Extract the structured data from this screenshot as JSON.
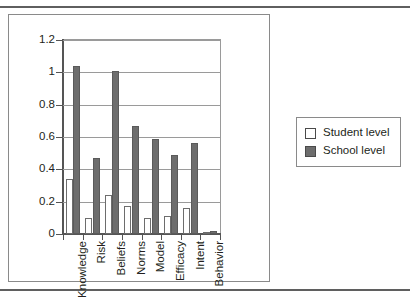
{
  "chart_data": {
    "type": "bar",
    "title": "",
    "xlabel": "",
    "ylabel": "",
    "categories": [
      "Knowledge",
      "Risk",
      "Beliefs",
      "Norms",
      "Model",
      "Efficacy",
      "Intent",
      "Behavior"
    ],
    "series": [
      {
        "name": "Student level",
        "values": [
          0.34,
          0.1,
          0.24,
          0.175,
          0.1,
          0.11,
          0.16,
          0.005
        ]
      },
      {
        "name": "School level",
        "values": [
          1.04,
          0.47,
          1.01,
          0.67,
          0.59,
          0.49,
          0.56,
          0.02
        ]
      }
    ],
    "ylim": [
      0,
      1.2
    ],
    "ytick_labels": [
      "1.2",
      "1",
      "0.8",
      "0.6",
      "0.4",
      "0.2",
      "0"
    ],
    "ytick_values": [
      1.2,
      1.0,
      0.8,
      0.6,
      0.4,
      0.2,
      0
    ],
    "grid": true,
    "legend_position": "right",
    "colors": {
      "student": "#ffffff",
      "school": "#6d6d6d",
      "outline": "#5a5a5a",
      "axis": "#555555",
      "grid": "#9a9a9a",
      "text": "#231f20"
    }
  },
  "legend": {
    "items": [
      {
        "label": "Student level",
        "swatch": "student"
      },
      {
        "label": "School level",
        "swatch": "school"
      }
    ]
  }
}
